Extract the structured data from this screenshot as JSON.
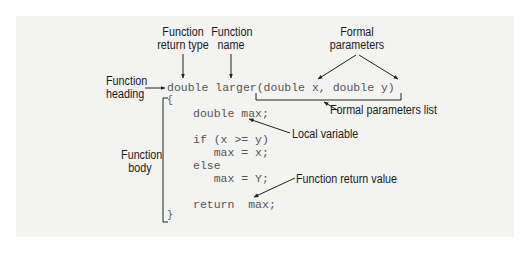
{
  "diagram": {
    "labels": {
      "return_type": [
        "Function",
        "return type"
      ],
      "name": [
        "Function",
        "name"
      ],
      "formal_parameters": [
        "Formal",
        "parameters"
      ],
      "heading": [
        "Function",
        "heading"
      ],
      "formal_parameters_list": "Formal parameters list",
      "local_variable": "Local variable",
      "body": [
        "Function",
        "body"
      ],
      "return_value": "Function return value"
    },
    "code": {
      "heading_line": "double larger(double x, double y)",
      "open_brace": "{",
      "lines": [
        "double max;",
        "if (x >= y)",
        "   max = x;",
        "else",
        "   max = Y;",
        "return  max;"
      ],
      "close_brace": "}"
    },
    "colors": {
      "panel": "#f3f3f2",
      "code_text": "#555555",
      "label_text": "#1a1a1a",
      "lines": "#222222"
    }
  }
}
